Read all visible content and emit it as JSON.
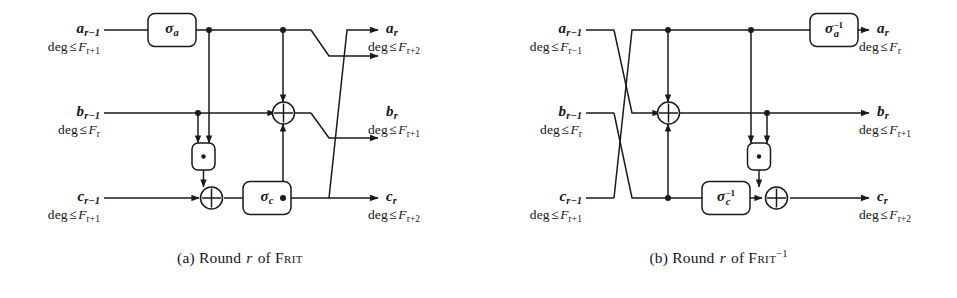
{
  "figure": {
    "panels": [
      {
        "id": "a",
        "caption_prefix": "(a)",
        "caption_word1": "Round",
        "caption_var": "r",
        "caption_word2": "of",
        "caption_name": "Frit",
        "caption_sup": "",
        "inputs": [
          {
            "name": "a",
            "sub": "r−1",
            "deg_label": "deg",
            "rel": "≤",
            "bound": "F",
            "bound_sub": "r+1"
          },
          {
            "name": "b",
            "sub": "r−1",
            "deg_label": "deg",
            "rel": "≤",
            "bound": "F",
            "bound_sub": "r"
          },
          {
            "name": "c",
            "sub": "r−1",
            "deg_label": "deg",
            "rel": "≤",
            "bound": "F",
            "bound_sub": "r+1"
          }
        ],
        "outputs": [
          {
            "name": "a",
            "sub": "r",
            "deg_label": "deg",
            "rel": "≤",
            "bound": "F",
            "bound_sub": "r+2"
          },
          {
            "name": "b",
            "sub": "r",
            "deg_label": "deg",
            "rel": "≤",
            "bound": "F",
            "bound_sub": "r+1"
          },
          {
            "name": "c",
            "sub": "r",
            "deg_label": "deg",
            "rel": "≤",
            "bound": "F",
            "bound_sub": "r+2"
          }
        ],
        "gates": [
          {
            "kind": "sigma",
            "glyph": "σ",
            "sub": "a",
            "inverse": false,
            "name": "sigma-a-gate"
          },
          {
            "kind": "sigma",
            "glyph": "σ",
            "sub": "c",
            "inverse": false,
            "name": "sigma-c-gate"
          },
          {
            "kind": "mul",
            "glyph": "·",
            "sub": "",
            "inverse": false,
            "name": "and-gate"
          },
          {
            "kind": "xor",
            "glyph": "⊕",
            "sub": "",
            "inverse": false,
            "name": "xor-gate-top"
          },
          {
            "kind": "xor",
            "glyph": "⊕",
            "sub": "",
            "inverse": false,
            "name": "xor-gate-bottom"
          }
        ]
      },
      {
        "id": "b",
        "caption_prefix": "(b)",
        "caption_word1": "Round",
        "caption_var": "r",
        "caption_word2": "of",
        "caption_name": "Frit",
        "caption_sup": "−1",
        "inputs": [
          {
            "name": "a",
            "sub": "r−1",
            "deg_label": "deg",
            "rel": "≤",
            "bound": "F",
            "bound_sub": "r−1"
          },
          {
            "name": "b",
            "sub": "r−1",
            "deg_label": "deg",
            "rel": "≤",
            "bound": "F",
            "bound_sub": "r"
          },
          {
            "name": "c",
            "sub": "r−1",
            "deg_label": "deg",
            "rel": "≤",
            "bound": "F",
            "bound_sub": "r+1"
          }
        ],
        "outputs": [
          {
            "name": "a",
            "sub": "r",
            "deg_label": "deg",
            "rel": "≤",
            "bound": "F",
            "bound_sub": "r"
          },
          {
            "name": "b",
            "sub": "r",
            "deg_label": "deg",
            "rel": "≤",
            "bound": "F",
            "bound_sub": "r+1"
          },
          {
            "name": "c",
            "sub": "r",
            "deg_label": "deg",
            "rel": "≤",
            "bound": "F",
            "bound_sub": "r+2"
          }
        ],
        "gates": [
          {
            "kind": "sigma",
            "glyph": "σ",
            "sub": "a",
            "inverse": true,
            "name": "sigma-a-inverse-gate"
          },
          {
            "kind": "sigma",
            "glyph": "σ",
            "sub": "c",
            "inverse": true,
            "name": "sigma-c-inverse-gate"
          },
          {
            "kind": "mul",
            "glyph": "·",
            "sub": "",
            "inverse": false,
            "name": "and-gate"
          },
          {
            "kind": "xor",
            "glyph": "⊕",
            "sub": "",
            "inverse": false,
            "name": "xor-gate-top"
          },
          {
            "kind": "xor",
            "glyph": "⊕",
            "sub": "",
            "inverse": false,
            "name": "xor-gate-bottom"
          }
        ]
      }
    ],
    "colors": {
      "ink": "#141414",
      "wire": "#1a1a1a",
      "background": "#ffffff"
    }
  }
}
